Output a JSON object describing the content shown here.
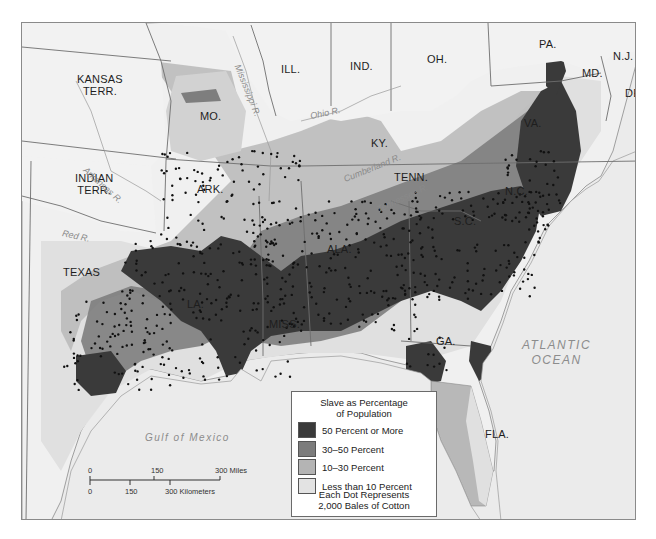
{
  "map": {
    "colors": {
      "background": "#e9e9e9",
      "ocean": "#ebebeb",
      "land_blank": "#f0f0f0",
      "border": "#6e6e6e",
      "river": "#8f8f8f",
      "dot": "#111111"
    },
    "states": [
      {
        "id": "kansas",
        "label": "KANSAS\nTERR.",
        "line1": "KANSAS",
        "line2": "TERR."
      },
      {
        "id": "indian",
        "label": "INDIAN TERR.",
        "line1": "INDIAN",
        "line2": "TERR."
      },
      {
        "id": "texas",
        "label": "TEXAS"
      },
      {
        "id": "mo",
        "label": "MO."
      },
      {
        "id": "ill",
        "label": "ILL."
      },
      {
        "id": "ind",
        "label": "IND."
      },
      {
        "id": "oh",
        "label": "OH."
      },
      {
        "id": "pa",
        "label": "PA."
      },
      {
        "id": "nj",
        "label": "N.J."
      },
      {
        "id": "md",
        "label": "MD."
      },
      {
        "id": "del",
        "label": "DEL."
      },
      {
        "id": "va",
        "label": "VA."
      },
      {
        "id": "ky",
        "label": "KY."
      },
      {
        "id": "tenn",
        "label": "TENN."
      },
      {
        "id": "nc",
        "label": "N.C."
      },
      {
        "id": "sc",
        "label": "S.C."
      },
      {
        "id": "ark",
        "label": "ARK."
      },
      {
        "id": "la",
        "label": "LA."
      },
      {
        "id": "miss",
        "label": "MISS."
      },
      {
        "id": "ala",
        "label": "ALA."
      },
      {
        "id": "ga",
        "label": "GA."
      },
      {
        "id": "fla",
        "label": "FLA."
      }
    ],
    "rivers": {
      "mississippi": "Mississippi R.",
      "ohio": "Ohio R.",
      "arkansas": "Arkansas R.",
      "red": "Red R.",
      "cumberland": "Cumberland R.",
      "tennessee": "Tennessee R."
    },
    "water_bodies": {
      "atlantic_line1": "ATLANTIC",
      "atlantic_line2": "OCEAN",
      "gulf": "Gulf of Mexico"
    }
  },
  "legend": {
    "title_line1": "Slave as Percentage",
    "title_line2": "of Population",
    "items": [
      {
        "label": "50 Percent or More",
        "color": "#3a3a3a"
      },
      {
        "label": "30–50 Percent",
        "color": "#7c7c7c"
      },
      {
        "label": "10–30 Percent",
        "color": "#b4b4b4"
      },
      {
        "label": "Less than 10 Percent",
        "color": "#e3e3e3"
      }
    ],
    "note_line1": "Each Dot Represents",
    "note_line2": "2,000 Bales of Cotton"
  },
  "scale_bar": {
    "miles": {
      "ticks": [
        "0",
        "150",
        "300 Miles"
      ]
    },
    "kilometers": {
      "ticks": [
        "0",
        "150",
        "300 Kilometers"
      ]
    }
  }
}
